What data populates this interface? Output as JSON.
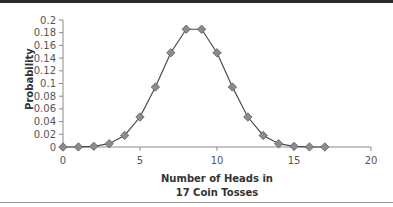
{
  "chart_data": {
    "type": "line",
    "title": "",
    "xlabel": "Number of Heads in 17 Coin Tosses",
    "xlabel_lines": [
      "Number of Heads in",
      "17 Coin Tosses"
    ],
    "ylabel": "Probability",
    "xlim": [
      0,
      20
    ],
    "ylim": [
      0,
      0.2
    ],
    "x_ticks": [
      0,
      5,
      10,
      15,
      20
    ],
    "y_ticks": [
      0,
      0.02,
      0.04,
      0.06,
      0.08,
      0.1,
      0.12,
      0.14,
      0.16,
      0.18,
      0.2
    ],
    "y_tick_labels": [
      "0",
      "0.02",
      "0.04",
      "0.06",
      "0.08",
      "0.1",
      "0.12",
      "0.14",
      "0.16",
      "0.18",
      "0.2"
    ],
    "grid": false,
    "legend": null,
    "series": [
      {
        "name": "Binomial probability",
        "marker": "diamond",
        "x": [
          0,
          1,
          2,
          3,
          4,
          5,
          6,
          7,
          8,
          9,
          10,
          11,
          12,
          13,
          14,
          15,
          16,
          17
        ],
        "values": [
          7.6e-06,
          0.00013,
          0.00104,
          0.00519,
          0.01816,
          0.04721,
          0.09442,
          0.14838,
          0.18547,
          0.18547,
          0.14838,
          0.09442,
          0.04721,
          0.01816,
          0.00519,
          0.00104,
          0.00013,
          7.6e-06
        ]
      }
    ]
  },
  "colors": {
    "line": "#4a4a4a",
    "marker_fill": "#8c8c8c",
    "marker_stroke": "#5e5e5e",
    "axis": "#8a8a8a"
  }
}
